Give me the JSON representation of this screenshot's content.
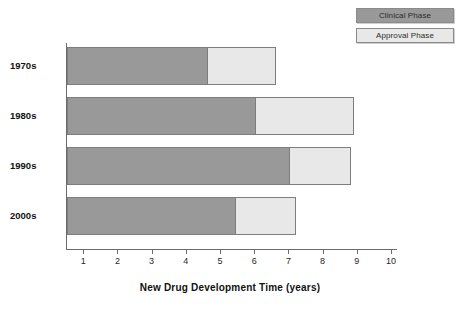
{
  "chart_data": {
    "type": "bar",
    "orientation": "horizontal",
    "stacked": true,
    "title": "",
    "xlabel": "New Drug Development Time (years)",
    "ylabel": "",
    "categories": [
      "1970s",
      "1980s",
      "1990s",
      "2000s"
    ],
    "series": [
      {
        "name": "Clinical Phase",
        "color": "#999999",
        "values": [
          4.6,
          6.0,
          7.0,
          5.4
        ]
      },
      {
        "name": "Approval Phase",
        "color": "#e8e8e8",
        "values": [
          2.0,
          2.9,
          1.8,
          1.8
        ]
      }
    ],
    "totals": [
      6.6,
      8.9,
      8.8,
      7.2
    ],
    "xlim": [
      0,
      10.5
    ],
    "xticks": [
      1,
      2,
      3,
      4,
      5,
      6,
      7,
      8,
      9,
      10
    ],
    "xtick_labels": [
      "1",
      "2",
      "3",
      "4",
      "5",
      "6",
      "7",
      "8",
      "9",
      "10"
    ],
    "grid": false,
    "legend_position": "top-right"
  },
  "legend": {
    "entries": [
      {
        "label": "Clinical Phase"
      },
      {
        "label": "Approval Phase"
      }
    ]
  },
  "axis": {
    "x_title": "New Drug Development Time (years)"
  }
}
